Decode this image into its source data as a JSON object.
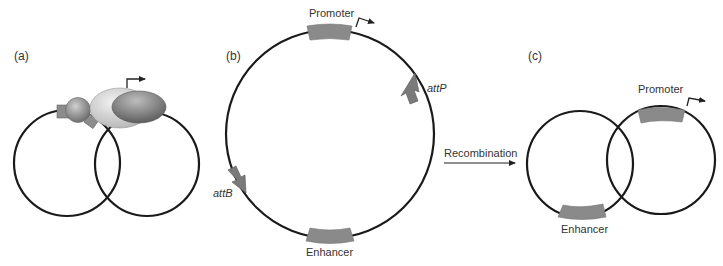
{
  "figure": {
    "panels": [
      {
        "id": "a",
        "label": "(a)",
        "description": "Two interlocked DNA circles with protein complex bridging them; transcription start arrow above"
      },
      {
        "id": "b",
        "label": "(b)",
        "elements": {
          "promoter": "Promoter",
          "enhancer": "Enhancer",
          "attP": "attP",
          "attB": "attB"
        }
      },
      {
        "id": "c",
        "label": "(c)",
        "elements": {
          "promoter": "Promoter",
          "enhancer": "Enhancer"
        }
      }
    ],
    "transition": {
      "label": "Recombination"
    },
    "colors": {
      "dna_strand": "#1a1a1a",
      "element_fill": "#8a8a8a",
      "protein_light": "#d6d6d6",
      "protein_dark": "#7a7a7a",
      "text": "#333333"
    }
  }
}
